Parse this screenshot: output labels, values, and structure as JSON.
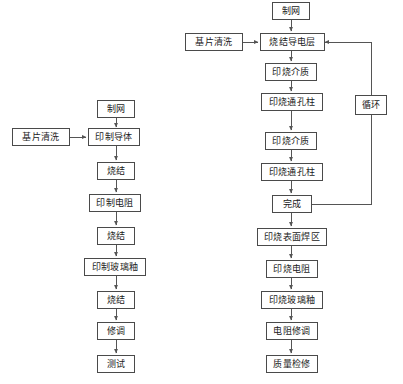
{
  "diagram": {
    "colors": {
      "background": "#ffffff",
      "box_border": "#4a4a4a",
      "line": "#555555",
      "text": "#1a1a1a"
    },
    "left_flow": {
      "name": "单层厚膜工艺流程",
      "nodes": [
        {
          "id": "l-zhiwang",
          "label": "制网",
          "x": 97,
          "y": 100,
          "w": 38,
          "h": 18
        },
        {
          "id": "l-jipianqingxi",
          "label": "基片清洗",
          "x": 12,
          "y": 128,
          "w": 58,
          "h": 18
        },
        {
          "id": "l-yinzhidaoti",
          "label": "印制导体",
          "x": 88,
          "y": 128,
          "w": 52,
          "h": 18
        },
        {
          "id": "l-shaojie-1",
          "label": "烧结",
          "x": 96,
          "y": 162,
          "w": 38,
          "h": 18
        },
        {
          "id": "l-yinzhidianzu",
          "label": "印制电阻",
          "x": 88,
          "y": 194,
          "w": 52,
          "h": 18
        },
        {
          "id": "l-shaojie-2",
          "label": "烧结",
          "x": 96,
          "y": 227,
          "w": 38,
          "h": 18
        },
        {
          "id": "l-boliyou",
          "label": "印制玻璃釉",
          "x": 84,
          "y": 258,
          "w": 62,
          "h": 18
        },
        {
          "id": "l-shaojie-3",
          "label": "烧结",
          "x": 96,
          "y": 291,
          "w": 38,
          "h": 18
        },
        {
          "id": "l-xiutiao",
          "label": "修调",
          "x": 96,
          "y": 322,
          "w": 38,
          "h": 18
        },
        {
          "id": "l-ceshi",
          "label": "测试",
          "x": 96,
          "y": 355,
          "w": 38,
          "h": 18
        }
      ]
    },
    "right_flow": {
      "name": "多层厚膜工艺流程",
      "nodes": [
        {
          "id": "r-zhiwang",
          "label": "制网",
          "x": 272,
          "y": 2,
          "w": 38,
          "h": 18
        },
        {
          "id": "r-jipianqingxi",
          "label": "基片清洗",
          "x": 185,
          "y": 33,
          "w": 58,
          "h": 18
        },
        {
          "id": "r-daodianceng",
          "label": "烧结导电层",
          "x": 260,
          "y": 33,
          "w": 63,
          "h": 18
        },
        {
          "id": "r-jiezhi-1",
          "label": "印烧介质",
          "x": 265,
          "y": 63,
          "w": 52,
          "h": 18
        },
        {
          "id": "r-tongkong-1",
          "label": "印烧通孔柱",
          "x": 261,
          "y": 93,
          "w": 62,
          "h": 18
        },
        {
          "id": "r-jiezhi-2",
          "label": "印烧介质",
          "x": 265,
          "y": 132,
          "w": 52,
          "h": 18
        },
        {
          "id": "r-tongkong-2",
          "label": "印烧通孔柱",
          "x": 261,
          "y": 163,
          "w": 62,
          "h": 18
        },
        {
          "id": "r-wancheng",
          "label": "完成",
          "x": 272,
          "y": 195,
          "w": 40,
          "h": 18
        },
        {
          "id": "r-xunhuan",
          "label": "循环",
          "x": 355,
          "y": 95,
          "w": 32,
          "h": 20
        },
        {
          "id": "r-hanqu",
          "label": "印烧表面焊区",
          "x": 257,
          "y": 228,
          "w": 70,
          "h": 18
        },
        {
          "id": "r-dianzu",
          "label": "印烧电阻",
          "x": 266,
          "y": 260,
          "w": 52,
          "h": 18
        },
        {
          "id": "r-boliyou",
          "label": "印烧玻璃釉",
          "x": 261,
          "y": 291,
          "w": 62,
          "h": 18
        },
        {
          "id": "r-xiutiao",
          "label": "电阻修调",
          "x": 266,
          "y": 322,
          "w": 52,
          "h": 18
        },
        {
          "id": "r-jianxiu",
          "label": "质量检修",
          "x": 266,
          "y": 355,
          "w": 52,
          "h": 18
        }
      ]
    },
    "connections": [
      {
        "from": "l-zhiwang",
        "to": "l-yinzhidaoti",
        "kind": "vertical-arrow"
      },
      {
        "from": "l-jipianqingxi",
        "to": "l-yinzhidaoti",
        "kind": "horizontal-arrow"
      },
      {
        "from": "l-yinzhidaoti",
        "to": "l-shaojie-1",
        "kind": "vertical-arrow"
      },
      {
        "from": "l-shaojie-1",
        "to": "l-yinzhidianzu",
        "kind": "vertical-arrow"
      },
      {
        "from": "l-yinzhidianzu",
        "to": "l-shaojie-2",
        "kind": "vertical-arrow"
      },
      {
        "from": "l-shaojie-2",
        "to": "l-boliyou",
        "kind": "vertical-arrow"
      },
      {
        "from": "l-boliyou",
        "to": "l-shaojie-3",
        "kind": "vertical-arrow"
      },
      {
        "from": "l-shaojie-3",
        "to": "l-xiutiao",
        "kind": "vertical-arrow"
      },
      {
        "from": "l-xiutiao",
        "to": "l-ceshi",
        "kind": "vertical-arrow"
      },
      {
        "from": "r-zhiwang",
        "to": "r-daodianceng",
        "kind": "vertical-arrow"
      },
      {
        "from": "r-jipianqingxi",
        "to": "r-daodianceng",
        "kind": "horizontal-arrow"
      },
      {
        "from": "r-daodianceng",
        "to": "r-jiezhi-1",
        "kind": "vertical-arrow"
      },
      {
        "from": "r-jiezhi-1",
        "to": "r-tongkong-1",
        "kind": "vertical-arrow"
      },
      {
        "from": "r-tongkong-1",
        "to": "r-jiezhi-2",
        "kind": "vertical-arrow"
      },
      {
        "from": "r-jiezhi-2",
        "to": "r-tongkong-2",
        "kind": "vertical-arrow"
      },
      {
        "from": "r-tongkong-2",
        "to": "r-wancheng",
        "kind": "vertical-arrow"
      },
      {
        "from": "r-wancheng",
        "to": "r-daodianceng",
        "kind": "feedback-loop",
        "via": "r-xunhuan"
      },
      {
        "from": "r-wancheng",
        "to": "r-hanqu",
        "kind": "vertical-arrow"
      },
      {
        "from": "r-hanqu",
        "to": "r-dianzu",
        "kind": "vertical-arrow"
      },
      {
        "from": "r-dianzu",
        "to": "r-boliyou",
        "kind": "vertical-arrow"
      },
      {
        "from": "r-boliyou",
        "to": "r-xiutiao",
        "kind": "vertical-arrow"
      },
      {
        "from": "r-xiutiao",
        "to": "r-jianxiu",
        "kind": "vertical-arrow"
      }
    ]
  }
}
